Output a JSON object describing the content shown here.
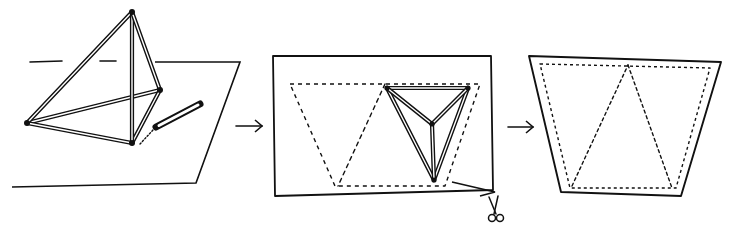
{
  "canvas": {
    "width": 731,
    "height": 238,
    "background": "#ffffff",
    "ink": "#111111"
  },
  "steps": [
    {
      "id": "step-1-tetrahedron-on-paper",
      "paper": [
        [
          155,
          62
        ],
        [
          240,
          62
        ],
        [
          196,
          183
        ],
        [
          12,
          187
        ]
      ],
      "horizon_dashes": [
        [
          [
            30,
            62
          ],
          [
            62,
            61
          ]
        ],
        [
          [
            100,
            61
          ],
          [
            116,
            61
          ]
        ]
      ],
      "tetra_apex": [
        132,
        12
      ],
      "tetra_base": [
        [
          27,
          123
        ],
        [
          132,
          143
        ],
        [
          160,
          90
        ]
      ],
      "pencil": {
        "tip": [
          156,
          127
        ],
        "end": [
          200,
          104
        ]
      },
      "trace_dots": [
        [
          140,
          144
        ],
        [
          153,
          130
        ]
      ]
    },
    {
      "id": "step-2-traced-and-cut",
      "paper": [
        [
          273,
          56
        ],
        [
          491,
          56
        ],
        [
          493,
          190
        ],
        [
          275,
          196
        ]
      ],
      "net_dashed": [
        [
          290,
          84
        ],
        [
          480,
          84
        ],
        [
          445,
          186
        ],
        [
          335,
          186
        ]
      ],
      "net_inner_dashed": [
        [
          385,
          84
        ],
        [
          338,
          186
        ]
      ],
      "tetra_outer": [
        [
          387,
          88
        ],
        [
          468,
          88
        ],
        [
          434,
          180
        ]
      ],
      "tetra_center": [
        432,
        124
      ],
      "cut_notch": [
        [
          452,
          182
        ],
        [
          495,
          192
        ],
        [
          480,
          196
        ]
      ],
      "scissors": {
        "x": 495,
        "y": 200
      }
    },
    {
      "id": "step-3-trapezoid-net",
      "outline": [
        [
          529,
          56
        ],
        [
          721,
          62
        ],
        [
          681,
          196
        ],
        [
          561,
          192
        ]
      ],
      "net_dashed": [
        [
          540,
          64
        ],
        [
          710,
          68
        ],
        [
          676,
          188
        ],
        [
          570,
          188
        ]
      ],
      "net_inner_dashed": [
        [
          [
            572,
            186
          ],
          [
            628,
            65
          ]
        ],
        [
          [
            628,
            65
          ],
          [
            672,
            188
          ]
        ]
      ]
    }
  ],
  "arrows": [
    {
      "name": "arrow-step-1-to-2",
      "from": [
        236,
        126
      ],
      "to": [
        262,
        126
      ]
    },
    {
      "name": "arrow-step-2-to-3",
      "from": [
        508,
        127
      ],
      "to": [
        533,
        127
      ]
    }
  ]
}
